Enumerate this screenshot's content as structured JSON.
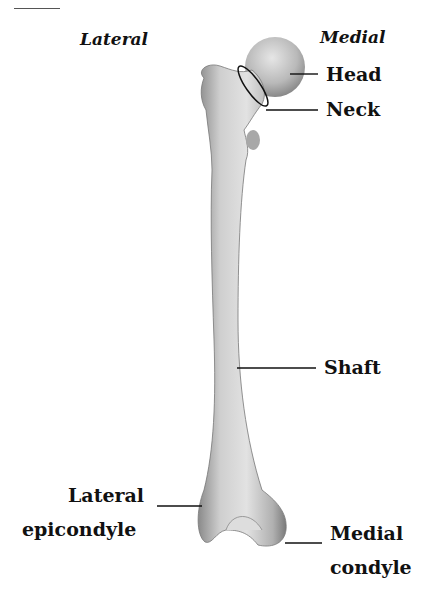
{
  "figure": {
    "orientation": {
      "left": "Lateral",
      "right": "Medial"
    },
    "labels": {
      "head": "Head",
      "neck": "Neck",
      "shaft": "Shaft",
      "lateral_epicondyle_line1": "Lateral",
      "lateral_epicondyle_line2": "epicondyle",
      "medial_condyle_line1": "Medial",
      "medial_condyle_line2": "condyle"
    }
  }
}
